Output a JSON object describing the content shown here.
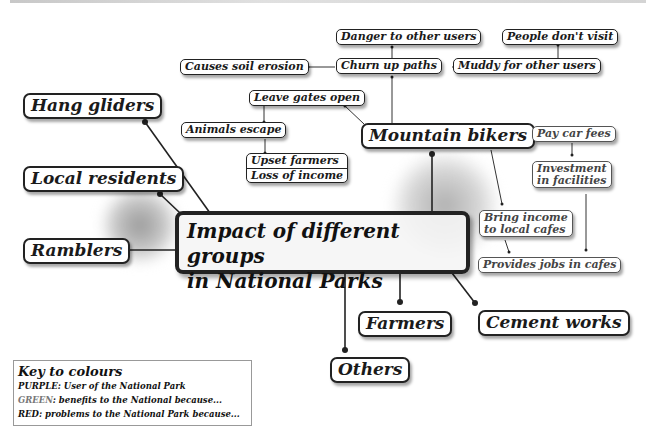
{
  "diagram": {
    "title": "Impact of different groups in National Parks",
    "title_lines": [
      "Impact of different groups",
      "in National Parks"
    ],
    "groups": {
      "hang_gliders": "Hang gliders",
      "local_residents": "Local residents",
      "ramblers": "Ramblers",
      "mountain_bikers": "Mountain bikers",
      "farmers": "Farmers",
      "cement_works": "Cement works",
      "others": "Others"
    },
    "mountain_bikers_problems": {
      "churn_up_paths": "Churn up paths",
      "danger_to_other_users": "Danger to other users",
      "causes_soil_erosion": "Causes soil erosion",
      "muddy_for_other_users": "Muddy for other users",
      "people_dont_visit": "People don't visit",
      "leave_gates_open": "Leave gates open",
      "animals_escape": "Animals escape",
      "upset_farmers": "Upset farmers",
      "loss_of_income": "Loss of income"
    },
    "mountain_bikers_benefits": {
      "pay_car_fees": "Pay car fees",
      "investment_in_facilities": [
        "Investment",
        "in facilities"
      ],
      "bring_income_to_local_cafes": [
        "Bring income",
        "to local cafes"
      ],
      "provides_jobs_in_cafes": "Provides jobs in cafes"
    }
  },
  "key": {
    "title": "Key to colours",
    "rows": [
      {
        "label": "PURPLE",
        "text": ": User of the National Park"
      },
      {
        "label": "GREEN",
        "text": ": benefits to the National because..."
      },
      {
        "label": "RED",
        "text": ": problems to the National Park because..."
      }
    ]
  },
  "colors": {
    "line": "#222222",
    "border": "#222222",
    "background": "#ffffff"
  }
}
